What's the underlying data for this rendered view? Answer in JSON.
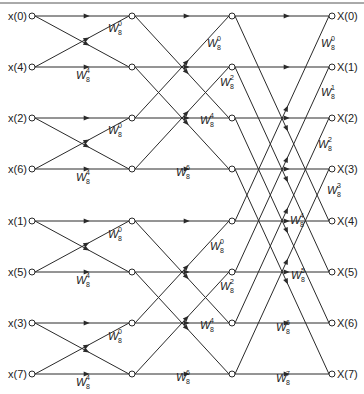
{
  "diagram": {
    "colors": {
      "line": "#2a2a2a",
      "text": "#222222",
      "background": "#ffffff"
    },
    "columns_x": [
      32,
      132,
      232,
      332
    ],
    "rows_y": [
      16,
      67,
      118,
      169,
      221,
      272,
      323,
      374
    ],
    "inputs": [
      "x(0)",
      "x(4)",
      "x(2)",
      "x(6)",
      "x(1)",
      "x(5)",
      "x(3)",
      "x(7)"
    ],
    "outputs": [
      "X(0)",
      "X(1)",
      "X(2)",
      "X(3)",
      "X(4)",
      "X(5)",
      "X(6)",
      "X(7)"
    ],
    "stages": [
      {
        "name": "stage-1",
        "from_col": 0,
        "to_col": 1,
        "pairs": [
          [
            0,
            1
          ],
          [
            2,
            3
          ],
          [
            4,
            5
          ],
          [
            6,
            7
          ]
        ]
      },
      {
        "name": "stage-2",
        "from_col": 1,
        "to_col": 2,
        "pairs": [
          [
            0,
            2
          ],
          [
            1,
            3
          ],
          [
            4,
            6
          ],
          [
            5,
            7
          ]
        ]
      },
      {
        "name": "stage-3",
        "from_col": 2,
        "to_col": 3,
        "pairs": [
          [
            0,
            4
          ],
          [
            1,
            5
          ],
          [
            2,
            6
          ],
          [
            3,
            7
          ]
        ]
      }
    ],
    "twiddles": [
      {
        "text": "W",
        "sup": "0",
        "sub": "8",
        "x": 108,
        "y": 38
      },
      {
        "text": "W",
        "sup": "4",
        "sub": "8",
        "x": 76,
        "y": 85
      },
      {
        "text": "W",
        "sup": "0",
        "sub": "8",
        "x": 108,
        "y": 140
      },
      {
        "text": "W",
        "sup": "4",
        "sub": "8",
        "x": 76,
        "y": 187
      },
      {
        "text": "W",
        "sup": "0",
        "sub": "8",
        "x": 108,
        "y": 244
      },
      {
        "text": "W",
        "sup": "4",
        "sub": "8",
        "x": 76,
        "y": 290
      },
      {
        "text": "W",
        "sup": "0",
        "sub": "8",
        "x": 108,
        "y": 346
      },
      {
        "text": "W",
        "sup": "4",
        "sub": "8",
        "x": 76,
        "y": 392
      },
      {
        "text": "W",
        "sup": "0",
        "sub": "8",
        "x": 207,
        "y": 53
      },
      {
        "text": "W",
        "sup": "2",
        "sub": "8",
        "x": 220,
        "y": 92
      },
      {
        "text": "W",
        "sup": "4",
        "sub": "8",
        "x": 200,
        "y": 130
      },
      {
        "text": "W",
        "sup": "6",
        "sub": "8",
        "x": 176,
        "y": 182
      },
      {
        "text": "W",
        "sup": "0",
        "sub": "8",
        "x": 210,
        "y": 256
      },
      {
        "text": "W",
        "sup": "2",
        "sub": "8",
        "x": 220,
        "y": 296
      },
      {
        "text": "W",
        "sup": "4",
        "sub": "8",
        "x": 200,
        "y": 335
      },
      {
        "text": "W",
        "sup": "6",
        "sub": "8",
        "x": 176,
        "y": 387
      },
      {
        "text": "W",
        "sup": "0",
        "sub": "8",
        "x": 321,
        "y": 53
      },
      {
        "text": "W",
        "sup": "1",
        "sub": "8",
        "x": 321,
        "y": 102
      },
      {
        "text": "W",
        "sup": "2",
        "sub": "8",
        "x": 318,
        "y": 154
      },
      {
        "text": "W",
        "sup": "3",
        "sub": "8",
        "x": 327,
        "y": 200
      },
      {
        "text": "W",
        "sup": "4",
        "sub": "8",
        "x": 290,
        "y": 230
      },
      {
        "text": "W",
        "sup": "5",
        "sub": "8",
        "x": 291,
        "y": 285
      },
      {
        "text": "W",
        "sup": "6",
        "sub": "8",
        "x": 276,
        "y": 337
      },
      {
        "text": "W",
        "sup": "7",
        "sub": "8",
        "x": 276,
        "y": 388
      }
    ]
  }
}
